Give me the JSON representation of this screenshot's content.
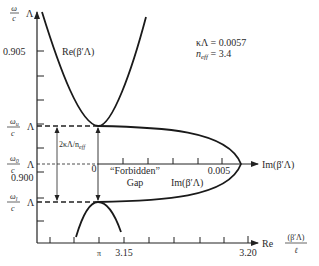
{
  "figure": {
    "y_axis": {
      "label_num": "ω",
      "label_den": "c",
      "label_suffix": "Λ",
      "ticks": [
        {
          "label": "0.905",
          "y": 51
        },
        {
          "label": "0.900",
          "y": 172
        }
      ],
      "levels": {
        "omega_u": {
          "num": "ωu",
          "den": "c",
          "suffix": "Λ"
        },
        "omega_0": {
          "num": "ω0",
          "den": "c",
          "suffix": "Λ"
        },
        "omega_l": {
          "num": "ωl",
          "den": "c",
          "suffix": "Λ"
        }
      }
    },
    "x_axis": {
      "label_prefix": "Re",
      "label_num": "(β′Λ)",
      "label_den": "ℓ",
      "tick_labels": [
        "π",
        "3.15",
        "3.20"
      ]
    },
    "im_axis": {
      "origin_label": "0",
      "tick_label": "0.005",
      "axis_label": "Im(β′Λ)"
    },
    "curve_labels": {
      "re": "Re(β′Λ)",
      "im": "Im(β′Λ)"
    },
    "gap_annotation": {
      "width_label": "2κΛ/n",
      "width_sub": "eff",
      "gap_line1": "“Forbidden”",
      "gap_line2": "Gap"
    },
    "parameters": {
      "kappa_lambda": "κΛ = 0.0057",
      "n_eff_label": "n",
      "n_eff_sub": "eff",
      "n_eff_value": " = 3.4"
    }
  }
}
